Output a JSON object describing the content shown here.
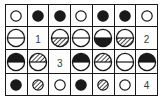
{
  "puzzle": {
    "title": "symbol-grid-puzzle",
    "columns": 7,
    "rows": 4,
    "colors": {
      "ink": "#1a1a1a",
      "fill_white": "#ffffff",
      "fill_black": "#1a1a1a",
      "hatch": "#1a1a1a",
      "cell_background": "#fdfdfd",
      "number_text": "#3a3a3a"
    },
    "legend": {
      "small_open": "small open circle",
      "small_solid": "small solid circle",
      "small_hatched": "small hatched circle",
      "half_top_bottom": "large circle divided by horizontal line",
      "number": "numeric label cell"
    },
    "cells": [
      [
        {
          "kind": "small",
          "top": "white",
          "bottom": "white",
          "name": "small-open-circle"
        },
        {
          "kind": "small",
          "top": "black",
          "bottom": "black",
          "name": "small-solid-circle"
        },
        {
          "kind": "small",
          "top": "black",
          "bottom": "black",
          "name": "small-solid-circle"
        },
        {
          "kind": "small",
          "top": "white",
          "bottom": "white",
          "name": "small-open-circle"
        },
        {
          "kind": "small",
          "top": "black",
          "bottom": "black",
          "name": "small-solid-circle"
        },
        {
          "kind": "small",
          "top": "black",
          "bottom": "black",
          "name": "small-solid-circle"
        },
        {
          "kind": "small",
          "top": "white",
          "bottom": "white",
          "name": "small-open-circle"
        }
      ],
      [
        {
          "kind": "large",
          "top": "white",
          "bottom": "white",
          "name": "half-circle-white-white"
        },
        {
          "kind": "number",
          "label": "1",
          "name": "number-cell-1"
        },
        {
          "kind": "large",
          "top": "white",
          "bottom": "hatch",
          "name": "half-circle-white-hatch"
        },
        {
          "kind": "large",
          "top": "white",
          "bottom": "white",
          "name": "half-circle-white-white"
        },
        {
          "kind": "large",
          "top": "white",
          "bottom": "black",
          "name": "half-circle-white-black"
        },
        {
          "kind": "large",
          "top": "white",
          "bottom": "hatch",
          "name": "half-circle-white-hatch"
        },
        {
          "kind": "number",
          "label": "2",
          "name": "number-cell-2"
        }
      ],
      [
        {
          "kind": "large",
          "top": "black",
          "bottom": "white",
          "name": "half-circle-black-white"
        },
        {
          "kind": "large",
          "top": "hatch",
          "bottom": "white",
          "name": "half-circle-hatch-white"
        },
        {
          "kind": "number",
          "label": "3",
          "name": "number-cell-3"
        },
        {
          "kind": "large",
          "top": "black",
          "bottom": "white",
          "name": "half-circle-black-white"
        },
        {
          "kind": "large",
          "top": "hatch",
          "bottom": "white",
          "name": "half-circle-hatch-white"
        },
        {
          "kind": "large",
          "top": "white",
          "bottom": "white",
          "name": "half-circle-white-white"
        },
        {
          "kind": "large",
          "top": "black",
          "bottom": "white",
          "name": "half-circle-black-white"
        }
      ],
      [
        {
          "kind": "small",
          "top": "black",
          "bottom": "black",
          "name": "small-solid-circle"
        },
        {
          "kind": "small",
          "top": "hatch",
          "bottom": "hatch",
          "name": "small-hatched-circle"
        },
        {
          "kind": "small",
          "top": "white",
          "bottom": "white",
          "name": "small-open-circle"
        },
        {
          "kind": "small",
          "top": "black",
          "bottom": "black",
          "name": "small-solid-circle"
        },
        {
          "kind": "small",
          "top": "hatch",
          "bottom": "hatch",
          "name": "small-hatched-circle"
        },
        {
          "kind": "small",
          "top": "white",
          "bottom": "white",
          "name": "small-open-circle"
        },
        {
          "kind": "number",
          "label": "4",
          "name": "number-cell-4"
        }
      ]
    ]
  }
}
